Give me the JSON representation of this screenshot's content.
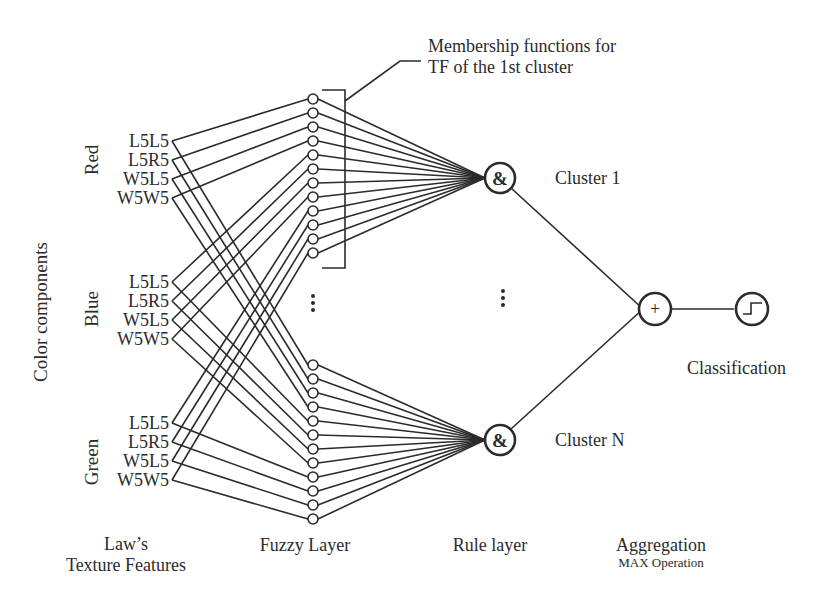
{
  "diagram": {
    "annotation": {
      "line1": "Membership functions for",
      "line2": "TF of the 1st cluster"
    },
    "axis_label": "Color components",
    "color_groups": [
      {
        "name": "Red",
        "features": [
          "L5L5",
          "L5R5",
          "W5L5",
          "W5W5"
        ]
      },
      {
        "name": "Blue",
        "features": [
          "L5L5",
          "L5R5",
          "W5L5",
          "W5W5"
        ]
      },
      {
        "name": "Green",
        "features": [
          "L5L5",
          "L5R5",
          "W5L5",
          "W5W5"
        ]
      }
    ],
    "fuzzy_layer": {
      "groups": 2,
      "nodes_per_group": 12,
      "ellipsis": "⋮"
    },
    "rule_nodes": [
      {
        "symbol": "&",
        "label": "Cluster 1"
      },
      {
        "symbol": "&",
        "label": "Cluster N"
      }
    ],
    "rule_ellipsis": "⋮",
    "aggregation_node": {
      "symbol": "+"
    },
    "classification_node": {
      "symbol": "step-function",
      "label": "Classification"
    },
    "layer_labels": {
      "input_line1": "Law’s",
      "input_line2": "Texture Features",
      "fuzzy": "Fuzzy Layer",
      "rule": "Rule layer",
      "aggregation": "Aggregation",
      "aggregation_sub": "MAX Operation"
    },
    "connections": {
      "input_to_fuzzy": "each of 12 inputs connects to node of same index in both fuzzy groups",
      "fuzzy_to_rule": "all 12 nodes of a group converge on its rule node",
      "rule_to_aggregation": "both rule nodes feed the aggregation node",
      "aggregation_to_classification": "single edge"
    }
  }
}
